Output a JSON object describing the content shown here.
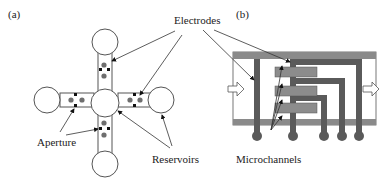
{
  "panels": {
    "a": {
      "label": "(a)"
    },
    "b": {
      "label": "(b)"
    }
  },
  "labels": {
    "electrodes": "Electrodes",
    "aperture": "Aperture",
    "reservoirs": "Reservoirs",
    "microchannels": "Microchannels"
  },
  "colors": {
    "stroke": "#555555",
    "particle": "#6e6e6e",
    "electrode_dark": "#5a5a5a",
    "channel_band": "#8a8a8a",
    "microchannel": "#8c8c8c"
  }
}
